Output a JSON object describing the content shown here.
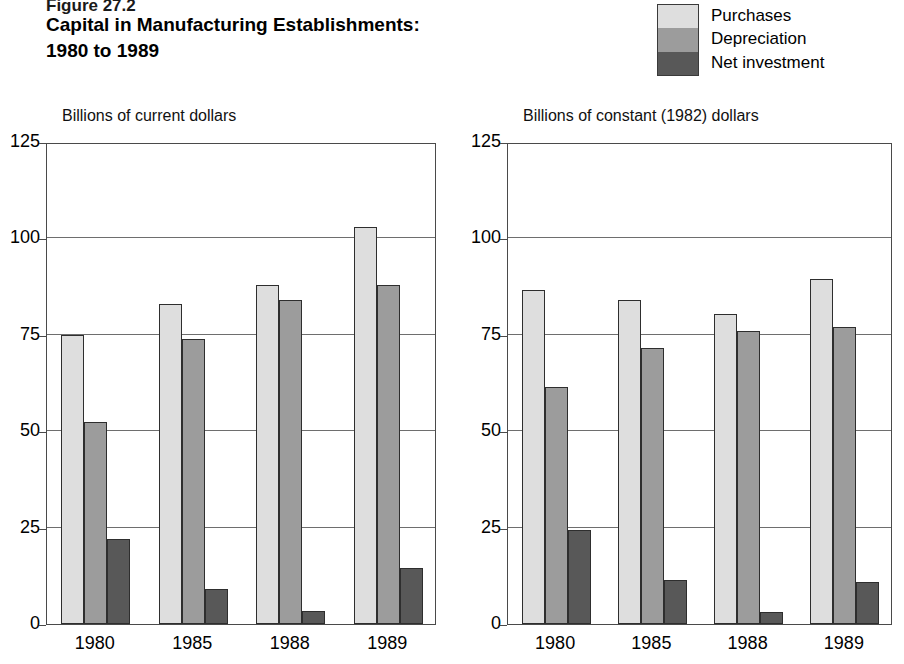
{
  "header": {
    "figure_number": "Figure 27.2",
    "title_line1": "Capital in Manufacturing Establishments:",
    "title_line2": "1980 to 1989"
  },
  "legend": {
    "items": [
      {
        "label": "Purchases",
        "color": "#dedede"
      },
      {
        "label": "Depreciation",
        "color": "#9c9c9c"
      },
      {
        "label": "Net investment",
        "color": "#585858"
      }
    ]
  },
  "chart_data": [
    {
      "type": "bar",
      "title": "Capital in Manufacturing Establishments: 1980 to 1989",
      "panel": "left",
      "ylabel": "Billions of current dollars",
      "xlabel": "",
      "categories": [
        "1980",
        "1985",
        "1988",
        "1989"
      ],
      "ylim": [
        0,
        125
      ],
      "yticks": [
        0,
        25,
        50,
        75,
        100,
        125
      ],
      "ytick_labels": [
        "0",
        "25",
        "50",
        "75",
        "100",
        "125"
      ],
      "grid": true,
      "legend_position": "top-right",
      "series": [
        {
          "name": "Purchases",
          "color": "#dedede",
          "values": [
            75.0,
            83.0,
            88.0,
            103.0
          ]
        },
        {
          "name": "Depreciation",
          "color": "#9c9c9c",
          "values": [
            52.5,
            74.0,
            84.0,
            88.0
          ]
        },
        {
          "name": "Net investment",
          "color": "#585858",
          "values": [
            22.0,
            9.0,
            3.5,
            14.5
          ]
        }
      ]
    },
    {
      "type": "bar",
      "title": "Capital in Manufacturing Establishments: 1980 to 1989",
      "panel": "right",
      "ylabel": "Billions of constant (1982) dollars",
      "xlabel": "",
      "categories": [
        "1980",
        "1985",
        "1988",
        "1989"
      ],
      "ylim": [
        0,
        125
      ],
      "yticks": [
        0,
        25,
        50,
        75,
        100,
        125
      ],
      "ytick_labels": [
        "0",
        "25",
        "50",
        "75",
        "100",
        "125"
      ],
      "grid": true,
      "legend_position": "top-right",
      "series": [
        {
          "name": "Purchases",
          "color": "#dedede",
          "values": [
            86.5,
            84.0,
            80.5,
            89.5
          ]
        },
        {
          "name": "Depreciation",
          "color": "#9c9c9c",
          "values": [
            61.5,
            71.5,
            76.0,
            77.0
          ]
        },
        {
          "name": "Net investment",
          "color": "#585858",
          "values": [
            24.5,
            11.5,
            3.0,
            11.0
          ]
        }
      ]
    }
  ],
  "layout": {
    "panels": [
      {
        "plot_left": 46,
        "plot_top": 143,
        "plot_width": 390,
        "plot_height": 482,
        "label_left": 62,
        "label_top": 107
      },
      {
        "plot_left": 507,
        "plot_top": 143,
        "plot_width": 385,
        "plot_height": 482,
        "label_left": 523,
        "label_top": 107
      }
    ]
  }
}
